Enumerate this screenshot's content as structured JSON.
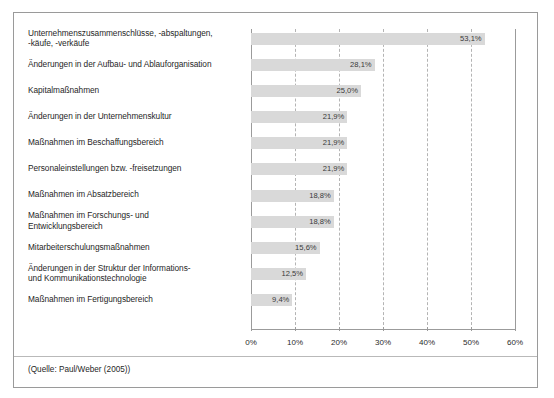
{
  "figure": {
    "source_note": "(Quelle: Paul/Weber (2005))"
  },
  "chart_data": {
    "type": "bar",
    "orientation": "horizontal",
    "title": "",
    "xlabel": "",
    "ylabel": "",
    "xlim": [
      0,
      60
    ],
    "xticks": [
      0,
      10,
      20,
      30,
      40,
      50,
      60
    ],
    "xtick_labels": [
      "0%",
      "10%",
      "20%",
      "30%",
      "40%",
      "50%",
      "60%"
    ],
    "grid": true,
    "grid_style": "dashed",
    "legend": false,
    "bar_color": "#d9d9d9",
    "categories": [
      "Unternehmenszusammenschlüsse, -abspaltungen, -käufe, -verkäufe",
      "Änderungen in der Aufbau- und Ablauforganisation",
      "Kapitalmaßnahmen",
      "Änderungen in der Unternehmenskultur",
      "Maßnahmen im Beschaffungsbereich",
      "Personaleinstellungen bzw. -freisetzungen",
      "Maßnahmen im Absatzbereich",
      "Maßnahmen im Forschungs- und Entwicklungsbereich",
      "Mitarbeiterschulungsmaßnahmen",
      "Änderungen in der Struktur der Informations- und Kommunikationstechnologie",
      "Maßnahmen im Fertigungsbereich"
    ],
    "category_lines": [
      [
        "Unternehmenszusammenschlüsse, -abspaltungen,",
        "-käufe, -verkäufe"
      ],
      [
        "Änderungen in der Aufbau- und Ablauforganisation"
      ],
      [
        "Kapitalmaßnahmen"
      ],
      [
        "Änderungen in der Unternehmenskultur"
      ],
      [
        "Maßnahmen im Beschaffungsbereich"
      ],
      [
        "Personaleinstellungen bzw. -freisetzungen"
      ],
      [
        "Maßnahmen im Absatzbereich"
      ],
      [
        "Maßnahmen im Forschungs- und",
        "Entwicklungsbereich"
      ],
      [
        "Mitarbeiterschulungsmaßnahmen"
      ],
      [
        "Änderungen in der Struktur der Informations-",
        "und Kommunikationstechnologie"
      ],
      [
        "Maßnahmen im Fertigungsbereich"
      ]
    ],
    "values": [
      53.1,
      28.1,
      25.0,
      21.9,
      21.9,
      21.9,
      18.8,
      18.8,
      15.6,
      12.5,
      9.4
    ],
    "value_labels": [
      "53,1%",
      "28,1%",
      "25,0%",
      "21,9%",
      "21,9%",
      "21,9%",
      "18,8%",
      "18,8%",
      "15,6%",
      "12,5%",
      "9,4%"
    ]
  }
}
